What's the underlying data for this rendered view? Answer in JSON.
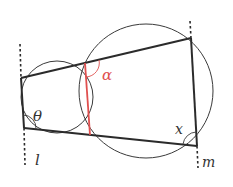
{
  "diagram": {
    "colors": {
      "stroke": "#2b2b2b",
      "circle": "#3a3a3a",
      "chord": "#e0504f",
      "alpha_label": "#e0504f",
      "text": "#333333"
    },
    "labels": {
      "theta": "θ",
      "alpha": "α",
      "x": "x",
      "l": "l",
      "m": "m"
    },
    "circles": [
      {
        "name": "small-circle",
        "cx": 57,
        "cy": 97,
        "r": 36
      },
      {
        "name": "large-circle",
        "cx": 146,
        "cy": 91,
        "r": 67
      }
    ],
    "points": {
      "P1": [
        21,
        78
      ],
      "P2": [
        24,
        128
      ],
      "A": [
        85,
        63
      ],
      "B": [
        90,
        135
      ],
      "Q1": [
        191,
        38
      ],
      "Q2": [
        197,
        146
      ]
    }
  }
}
